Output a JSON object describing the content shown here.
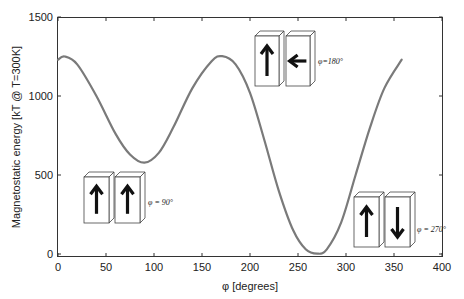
{
  "chart_data": {
    "type": "line",
    "title": "",
    "xlabel": "φ [degrees]",
    "ylabel": "Magnetostatic energy [kT @ T=300K]",
    "xlim": [
      0,
      400
    ],
    "ylim": [
      0,
      1500
    ],
    "xticks": [
      0,
      50,
      100,
      150,
      200,
      250,
      300,
      350,
      400
    ],
    "yticks": [
      0,
      500,
      1000,
      1500
    ],
    "grid": false,
    "legend": null,
    "line_color": "#7a7a7a",
    "series": [
      {
        "name": "Magnetostatic energy",
        "x": [
          0,
          7,
          20,
          40,
          60,
          75,
          90,
          105,
          120,
          140,
          160,
          171,
          185,
          200,
          215,
          230,
          245,
          258,
          270,
          280,
          295,
          310,
          325,
          340,
          358
        ],
        "values": [
          1230,
          1250,
          1200,
          1000,
          760,
          630,
          578,
          640,
          800,
          1050,
          1220,
          1252,
          1200,
          1020,
          720,
          400,
          150,
          30,
          2,
          30,
          200,
          500,
          800,
          1050,
          1230
        ]
      }
    ],
    "annotations": [
      {
        "text": "φ = 90°",
        "x_deg": 90,
        "magnet_left": "up",
        "magnet_right": "up"
      },
      {
        "text": "φ = 180°",
        "x_deg": 180,
        "magnet_left": "up",
        "magnet_right": "left"
      },
      {
        "text": "φ = 270°",
        "x_deg": 270,
        "magnet_left": "up",
        "magnet_right": "down"
      }
    ]
  },
  "labels": {
    "xlabel": "φ [degrees]",
    "ylabel": "Magnetostatic energy [kT @ T=300K]",
    "annot_90": "φ = 90°",
    "annot_180": "φ=180°",
    "annot_270": "φ = 270°"
  },
  "xtick_labels": [
    "0",
    "50",
    "100",
    "150",
    "200",
    "250",
    "300",
    "350",
    "400"
  ],
  "ytick_labels": [
    "0",
    "500",
    "1000",
    "1500"
  ]
}
